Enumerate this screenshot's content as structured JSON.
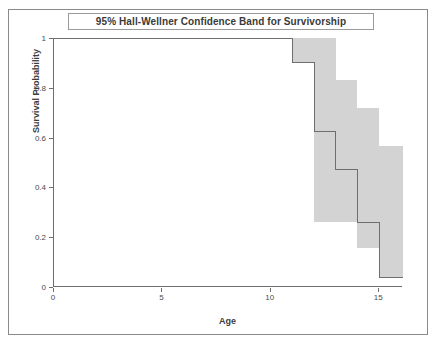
{
  "chart_data": {
    "type": "line",
    "title": "95% Hall-Wellner Confidence Band for Survivorship",
    "xlabel": "Age",
    "ylabel": "Survival Probability",
    "xlim": [
      0,
      16.1
    ],
    "ylim": [
      0,
      1
    ],
    "grid": false,
    "legend": "none",
    "xticks": [
      0,
      5,
      10,
      15
    ],
    "xtick_labels": [
      "0",
      "5",
      "10",
      "15"
    ],
    "yticks": [
      0,
      0.2,
      0.4,
      0.6,
      0.8,
      1
    ],
    "ytick_labels": [
      "0",
      "0.2",
      "0.4",
      "0.6",
      "0.8",
      "1"
    ],
    "band_color": "#d3d3d3",
    "line_color": "#6e6e6e",
    "series": [
      {
        "name": "Survival estimate",
        "kind": "step",
        "x": [
          0,
          11,
          12,
          13,
          14,
          15,
          16.1
        ],
        "y": [
          1.0,
          0.9,
          0.625,
          0.47,
          0.26,
          0.04,
          0.04
        ]
      },
      {
        "name": "95% Hall-Wellner upper band",
        "kind": "step-band-upper",
        "x": [
          11,
          12,
          13,
          14,
          15,
          16.1
        ],
        "y": [
          1.0,
          1.0,
          0.83,
          0.72,
          0.565,
          0.565
        ]
      },
      {
        "name": "95% Hall-Wellner lower band",
        "kind": "step-band-lower",
        "x": [
          11,
          12,
          13,
          14,
          15,
          16.1
        ],
        "y": [
          0.9,
          0.26,
          0.26,
          0.155,
          0.035,
          0.0
        ]
      }
    ]
  },
  "figure": {
    "title": "95% Hall-Wellner Confidence Band for Survivorship",
    "xlabel": "Age",
    "ylabel": "Survival Probability"
  }
}
